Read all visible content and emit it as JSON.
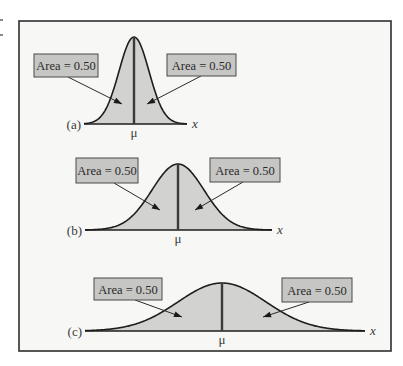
{
  "figure": {
    "frame": {
      "x": 19,
      "y": 21,
      "w": 372,
      "h": 330
    },
    "colors": {
      "fill": "#d2d2d0",
      "curve": "#1e1e1e",
      "mean_line": "#3a3a3a",
      "box_fill": "#c6c6c4",
      "frame_bg": "#f7f7f6"
    },
    "axis_symbol": "x",
    "mean_symbol": "μ",
    "panels": [
      {
        "id": "a",
        "label": "(a)",
        "axis_y": 124,
        "x_start": 84,
        "x_end": 187,
        "mu_x": 134,
        "peak_y": 37,
        "sigma_px": 15,
        "left_box": {
          "text": "Area = 0.50",
          "x": 34,
          "y": 54,
          "w": 64,
          "h": 23,
          "arrow_from": [
            68,
            77
          ],
          "arrow_to": [
            122,
            104
          ]
        },
        "right_box": {
          "text": "Area = 0.50",
          "x": 167,
          "y": 54,
          "w": 69,
          "h": 22,
          "arrow_from": [
            201,
            76
          ],
          "arrow_to": [
            147,
            104
          ]
        }
      },
      {
        "id": "b",
        "label": "(b)",
        "axis_y": 230,
        "x_start": 85,
        "x_end": 272,
        "mu_x": 178,
        "peak_y": 164,
        "sigma_px": 26,
        "left_box": {
          "text": "Area = 0.50",
          "x": 76,
          "y": 158,
          "w": 62,
          "h": 25,
          "arrow_from": [
            114,
            183
          ],
          "arrow_to": [
            160,
            210
          ]
        },
        "right_box": {
          "text": "Area = 0.50",
          "x": 210,
          "y": 158,
          "w": 70,
          "h": 24,
          "arrow_from": [
            243,
            182
          ],
          "arrow_to": [
            195,
            210
          ]
        }
      },
      {
        "id": "c",
        "label": "(c)",
        "axis_y": 331,
        "x_start": 85,
        "x_end": 365,
        "mu_x": 222,
        "peak_y": 283,
        "sigma_px": 44,
        "left_box": {
          "text": "Area = 0.50",
          "x": 94,
          "y": 278,
          "w": 68,
          "h": 22,
          "arrow_from": [
            135,
            300
          ],
          "arrow_to": [
            182,
            317
          ]
        },
        "right_box": {
          "text": "Area = 0.50",
          "x": 282,
          "y": 278,
          "w": 70,
          "h": 24,
          "arrow_from": [
            309,
            302
          ],
          "arrow_to": [
            263,
            317
          ]
        }
      }
    ]
  }
}
